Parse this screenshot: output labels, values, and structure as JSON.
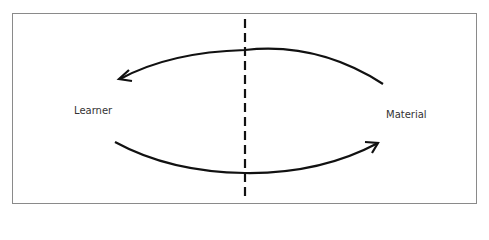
{
  "diagram": {
    "nodes": [
      {
        "id": "learner",
        "label": "Learner"
      },
      {
        "id": "material",
        "label": "Material"
      }
    ],
    "edges": [
      {
        "from": "material",
        "to": "learner",
        "style": "curved-arrow-top"
      },
      {
        "from": "learner",
        "to": "material",
        "style": "curved-arrow-bottom"
      }
    ],
    "divider": {
      "style": "dashed-vertical"
    },
    "colors": {
      "stroke": "#111111",
      "border": "#8a8a8a",
      "text": "#333333"
    }
  }
}
